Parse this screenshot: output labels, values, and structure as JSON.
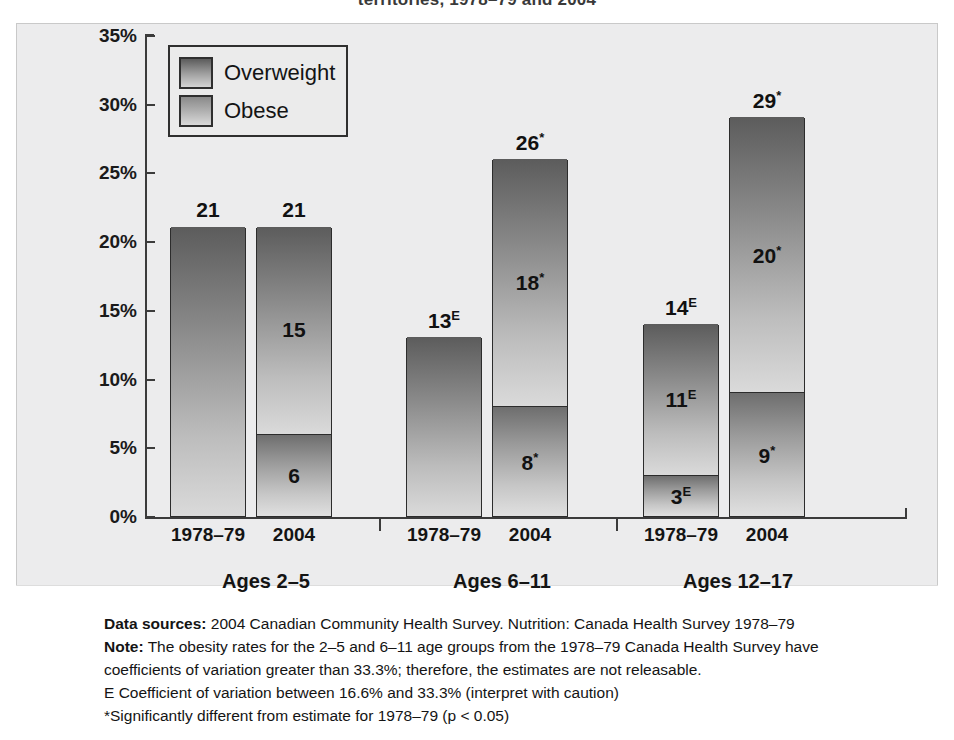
{
  "chart_data": {
    "type": "bar",
    "subtype": "stacked-bar-grouped",
    "title": "territories, 1978–79 and 2004",
    "xlabel": "",
    "ylabel": "",
    "ylim": [
      0,
      35
    ],
    "ytick_labels": [
      "35%",
      "30%",
      "25%",
      "20%",
      "15%",
      "10%",
      "5%",
      "0%"
    ],
    "ytick_values": [
      35,
      30,
      25,
      20,
      15,
      10,
      5,
      0
    ],
    "grid": false,
    "legend_position": "top-left",
    "legend": [
      "Overweight",
      "Obese"
    ],
    "categories": [
      "1978–79",
      "2004",
      "1978–79",
      "2004",
      "1978–79",
      "2004"
    ],
    "groups": [
      "Ages 2–5",
      "Ages 6–11",
      "Ages 12–17"
    ],
    "series": [
      {
        "name": "Overweight",
        "values": [
          21,
          15,
          13,
          18,
          11,
          20
        ]
      },
      {
        "name": "Obese",
        "values": [
          0,
          6,
          0,
          8,
          3,
          9
        ]
      }
    ],
    "bars": [
      {
        "group": "Ages 2–5",
        "period": "1978–79",
        "total": 21,
        "total_label": "21",
        "total_sup": "",
        "overweight": {
          "value": 21,
          "label": "",
          "sup": ""
        },
        "obese": {
          "value": 0,
          "label": "",
          "sup": ""
        }
      },
      {
        "group": "Ages 2–5",
        "period": "2004",
        "total": 21,
        "total_label": "21",
        "total_sup": "",
        "overweight": {
          "value": 15,
          "label": "15",
          "sup": ""
        },
        "obese": {
          "value": 6,
          "label": "6",
          "sup": ""
        }
      },
      {
        "group": "Ages 6–11",
        "period": "1978–79",
        "total": 13,
        "total_label": "13",
        "total_sup": "E",
        "overweight": {
          "value": 13,
          "label": "",
          "sup": ""
        },
        "obese": {
          "value": 0,
          "label": "",
          "sup": ""
        }
      },
      {
        "group": "Ages 6–11",
        "period": "2004",
        "total": 26,
        "total_label": "26",
        "total_sup": "*",
        "overweight": {
          "value": 18,
          "label": "18",
          "sup": "*"
        },
        "obese": {
          "value": 8,
          "label": "8",
          "sup": "*"
        }
      },
      {
        "group": "Ages 12–17",
        "period": "1978–79",
        "total": 14,
        "total_label": "14",
        "total_sup": "E",
        "overweight": {
          "value": 11,
          "label": "11",
          "sup": "E"
        },
        "obese": {
          "value": 3,
          "label": "3",
          "sup": "E"
        }
      },
      {
        "group": "Ages 12–17",
        "period": "2004",
        "total": 29,
        "total_label": "29",
        "total_sup": "*",
        "overweight": {
          "value": 20,
          "label": "20",
          "sup": "*"
        },
        "obese": {
          "value": 9,
          "label": "9",
          "sup": "*"
        }
      }
    ],
    "colors": {
      "panel_background": "#ececed",
      "bar_gradient_top": "#5c5c5c",
      "bar_gradient_bottom": "#dedede",
      "axis": "#3b3b3b",
      "text": "#141414"
    }
  },
  "footnotes": {
    "line1_label": "Data sources:",
    "line1_text": " 2004 Canadian Community Health Survey. Nutrition: Canada Health Survey 1978–79",
    "line2_label": "Note:",
    "line2_text": " The obesity rates for the 2–5 and 6–11 age groups from the 1978–79 Canada Health Survey have",
    "line3_text": "coefficients of variation greater than 33.3%; therefore, the estimates are not releasable.",
    "line4_text": "E Coefficient of variation between 16.6% and 33.3% (interpret with caution)",
    "line5_text": "*Significantly different from estimate for 1978–79 (p < 0.05)"
  }
}
